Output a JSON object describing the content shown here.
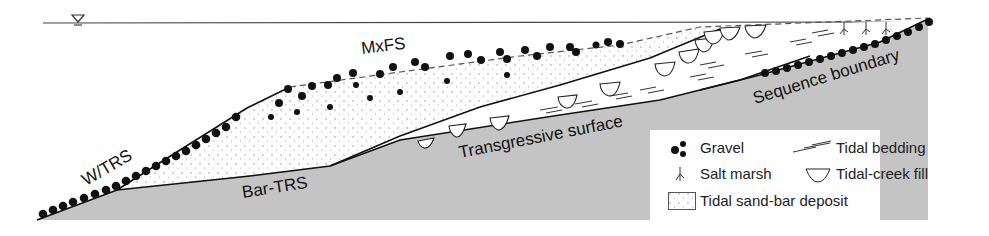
{
  "diagram": {
    "title": "",
    "labels": {
      "mxfs": "MxFS",
      "wtrs": "W/TRS",
      "bar_trs": "Bar-TRS",
      "transgressive_surface": "Transgressive surface",
      "sequence_boundary": "Sequence boundary"
    },
    "water_level_symbol": "sea-level-triangle",
    "colors": {
      "basement": "#c4c4c4",
      "line": "#111111",
      "sand_dots": "#8a8a8a",
      "gravel": "#111111",
      "background": "#ffffff"
    }
  },
  "legend": {
    "items": [
      {
        "icon": "gravel-icon",
        "label": "Gravel"
      },
      {
        "icon": "tidal-bedding-icon",
        "label": "Tidal bedding"
      },
      {
        "icon": "salt-marsh-icon",
        "label": "Salt marsh"
      },
      {
        "icon": "tidal-creek-fill-icon",
        "label": "Tidal-creek fill"
      },
      {
        "icon": "tidal-sand-bar-icon",
        "label": "Tidal sand-bar deposit"
      }
    ]
  }
}
